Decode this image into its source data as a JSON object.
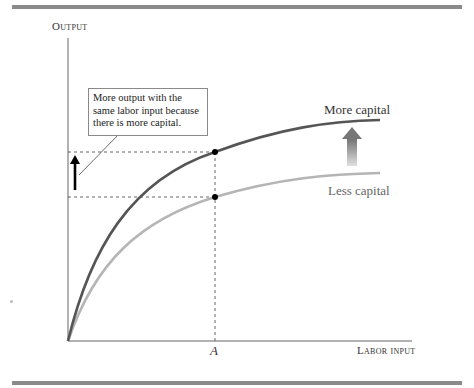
{
  "diagram": {
    "axes": {
      "y_label": "Output",
      "x_label": "Labor input",
      "x_tick": "A"
    },
    "curves": [
      {
        "name": "more-capital",
        "label": "More capital",
        "color": "#555555"
      },
      {
        "name": "less-capital",
        "label": "Less capital",
        "color": "#b5b5b5"
      }
    ],
    "callout": {
      "text": "More output with the same labor input because there is more capital."
    },
    "colors": {
      "rule": "#8a8a8a",
      "axis": "#666666",
      "dashed": "#555555",
      "point": "#000000",
      "arrow_small": "#000000",
      "arrow_gradient_top": "#777777",
      "arrow_gradient_bottom": "#dddddd"
    }
  }
}
